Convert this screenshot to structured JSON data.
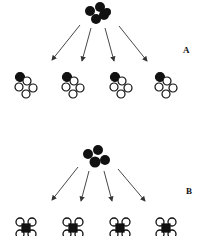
{
  "panels": [
    {
      "label": "A",
      "parent": {
        "cx": 97,
        "cy": 14,
        "cells": 5,
        "fill": "black"
      },
      "children": [
        {
          "cx": 25,
          "cy": 88
        },
        {
          "cx": 72,
          "cy": 88
        },
        {
          "cx": 120,
          "cy": 88
        },
        {
          "cx": 165,
          "cy": 88
        }
      ],
      "child_style": "one-dark-four-light"
    },
    {
      "label": "B",
      "parent": {
        "cx": 96,
        "cy": 159,
        "cells": 4,
        "fill": "black"
      },
      "children": [
        {
          "cx": 26,
          "cy": 228
        },
        {
          "cx": 73,
          "cy": 228
        },
        {
          "cx": 120,
          "cy": 228
        },
        {
          "cx": 166,
          "cy": 228
        }
      ],
      "child_style": "dark-center-light-corners"
    }
  ],
  "colors": {
    "ink": "#111111",
    "background": "#ffffff",
    "arrow": "#333333"
  }
}
